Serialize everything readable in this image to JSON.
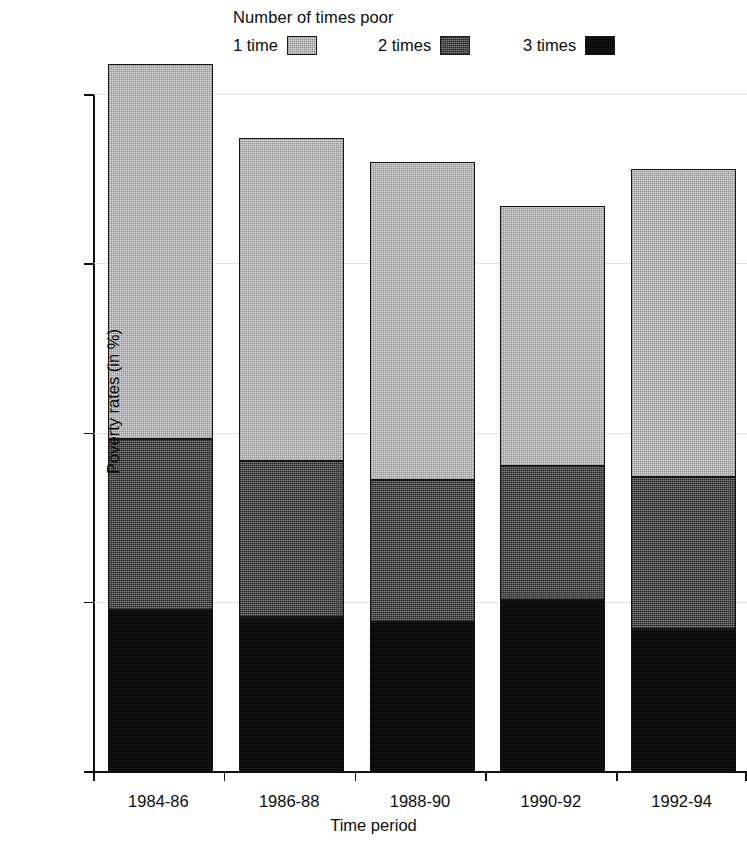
{
  "chart_data": {
    "type": "bar",
    "subtype": "stacked-vertical",
    "title": "",
    "xlabel": "Time period",
    "ylabel": "Poverty rates (in %)",
    "categories": [
      "1984-86",
      "1986-88",
      "1988-90",
      "1990-92",
      "1992-94"
    ],
    "series": [
      {
        "name": "1 time",
        "values": [
          11.1,
          9.55,
          9.4,
          7.7,
          9.1
        ],
        "color": "#d8d8d8"
      },
      {
        "name": "2 times",
        "values": [
          5.05,
          4.6,
          4.2,
          3.95,
          4.5
        ],
        "color": "#5d5d5d"
      },
      {
        "name": "3 times",
        "values": [
          4.75,
          4.55,
          4.4,
          5.05,
          4.2
        ],
        "color": "#121212"
      }
    ],
    "cumulative_tops": [
      {
        "category": "1984-86",
        "3_times": 4.75,
        "plus_2_times": 9.8,
        "total": 20.9
      },
      {
        "category": "1986-88",
        "3_times": 4.55,
        "plus_2_times": 9.15,
        "total": 18.7
      },
      {
        "category": "1988-90",
        "3_times": 4.4,
        "plus_2_times": 8.6,
        "total": 18.0
      },
      {
        "category": "1990-92",
        "3_times": 5.05,
        "plus_2_times": 9.0,
        "total": 16.7
      },
      {
        "category": "1992-94",
        "3_times": 4.2,
        "plus_2_times": 8.7,
        "total": 17.8
      }
    ],
    "ylim": [
      0,
      21.6
    ],
    "yticks": [
      0,
      5,
      10,
      15,
      20
    ],
    "ytick_labels": [
      "0",
      "5",
      "10",
      "15",
      "20"
    ],
    "grid": "horizontal",
    "legend_position": "top-center",
    "legend_title": "Number of times poor"
  },
  "legend": {
    "title": "Number of times poor",
    "items": [
      {
        "label": "1 time",
        "swatch": "legend-swatch-1-time"
      },
      {
        "label": "2 times",
        "swatch": "legend-swatch-2-times"
      },
      {
        "label": "3 times",
        "swatch": "legend-swatch-3-times"
      }
    ]
  },
  "axes": {
    "x_title": "Time period",
    "y_title": "Poverty rates (in %)",
    "y_ticks": [
      "0",
      "5",
      "10",
      "15",
      "20"
    ],
    "x_ticks": [
      "1984-86",
      "1986-88",
      "1988-90",
      "1990-92",
      "1992-94"
    ]
  },
  "colors": {
    "one_time": "#d8d8d8",
    "two_times": "#5d5d5d",
    "three_times": "#121212",
    "axis": "#111111",
    "grid": "#e2e2e2",
    "background": "#ffffff"
  }
}
